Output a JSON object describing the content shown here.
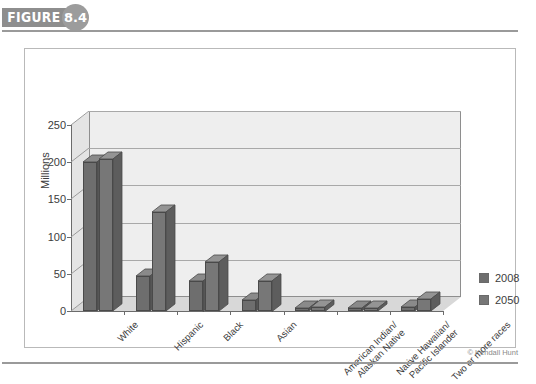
{
  "figure": {
    "tag_label": "FIGURE",
    "number": "8.4"
  },
  "credit": "© Kendall Hunt",
  "legend": {
    "items": [
      {
        "label": "2008",
        "color": "#6e6e6e"
      },
      {
        "label": "2050",
        "color": "#777777"
      }
    ]
  },
  "chart_data": {
    "type": "bar",
    "title": "",
    "xlabel": "",
    "ylabel": "Millions",
    "ylim": [
      0,
      250
    ],
    "yticks": [
      0,
      50,
      100,
      150,
      200,
      250
    ],
    "ytick_labels": [
      "0",
      "50",
      "100",
      "150",
      "200",
      "250"
    ],
    "grid": true,
    "legend_position": "right",
    "three_d": true,
    "categories": [
      "White",
      "Hispanic",
      "Black",
      "Asian",
      "American Indian/\nAlaskan Native",
      "Native Hawaiian/\nPacific Islander",
      "Two or more races"
    ],
    "series": [
      {
        "name": "2008",
        "color": "#6e6e6e",
        "values": [
          200,
          47,
          41,
          15,
          3,
          1,
          5
        ]
      },
      {
        "name": "2050",
        "color": "#777777",
        "values": [
          204,
          133,
          66,
          41,
          6,
          3,
          16
        ]
      }
    ]
  }
}
